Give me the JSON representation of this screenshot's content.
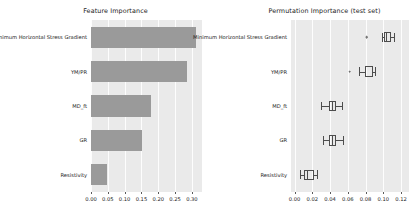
{
  "figure": {
    "background": "#ffffff",
    "axes_background": "#eaeaea",
    "bar_color": "#9a9a9a",
    "line_color": "#4d4d4d"
  },
  "chart_data": [
    {
      "type": "bar",
      "orientation": "horizontal",
      "title": "Feature Importance",
      "xlabel": "",
      "ylabel": "",
      "grid": true,
      "legend": "none",
      "categories": [
        "Minimum Horizontal Stress Gradient",
        "YM/PR",
        "MD_ft",
        "GR",
        "Resistivity"
      ],
      "values": [
        0.313,
        0.285,
        0.178,
        0.152,
        0.048
      ],
      "xlim": [
        0.0,
        0.33
      ],
      "xticks": [
        0.0,
        0.05,
        0.1,
        0.15,
        0.2,
        0.25,
        0.3
      ],
      "xticklabels": [
        "0.00",
        "0.05",
        "0.10",
        "0.15",
        "0.20",
        "0.25",
        "0.30"
      ]
    },
    {
      "type": "boxplot",
      "orientation": "horizontal",
      "title": "Permutation Importance (test set)",
      "xlabel": "",
      "ylabel": "",
      "grid": true,
      "legend": "none",
      "categories": [
        "Minimum Horizontal Stress Gradient",
        "YM/PR",
        "MD_ft",
        "GR",
        "Resistivity"
      ],
      "boxes": [
        {
          "category": "Minimum Horizontal Stress Gradient",
          "whisker_low": 0.0985,
          "q1": 0.1005,
          "median": 0.1035,
          "q3": 0.109,
          "whisker_high": 0.1125,
          "outliers": [
            0.0815
          ]
        },
        {
          "category": "YM/PR",
          "whisker_low": 0.073,
          "q1": 0.079,
          "median": 0.0795,
          "q3": 0.088,
          "whisker_high": 0.0905,
          "outliers": [
            0.062
          ]
        },
        {
          "category": "MD_ft",
          "whisker_low": 0.03,
          "q1": 0.039,
          "median": 0.0425,
          "q3": 0.047,
          "whisker_high": 0.053,
          "outliers": []
        },
        {
          "category": "GR",
          "whisker_low": 0.032,
          "q1": 0.039,
          "median": 0.0425,
          "q3": 0.047,
          "whisker_high": 0.0545,
          "outliers": []
        },
        {
          "category": "Resistivity",
          "whisker_low": 0.006,
          "q1": 0.011,
          "median": 0.0145,
          "q3": 0.0215,
          "whisker_high": 0.0255,
          "outliers": []
        }
      ],
      "xlim": [
        -0.004,
        0.129
      ],
      "xticks": [
        0.0,
        0.02,
        0.04,
        0.06,
        0.08,
        0.1,
        0.12
      ],
      "xticklabels": [
        "0.00",
        "0.02",
        "0.04",
        "0.06",
        "0.08",
        "0.10",
        "0.12"
      ]
    }
  ]
}
